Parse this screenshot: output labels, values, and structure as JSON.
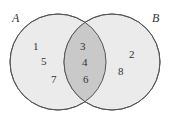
{
  "diagram": {
    "type": "venn",
    "sets": [
      {
        "name": "A",
        "label": "A",
        "only": [
          "1",
          "5",
          "7"
        ]
      },
      {
        "name": "B",
        "label": "B",
        "only": [
          "2",
          "8"
        ]
      }
    ],
    "intersection": [
      "3",
      "4",
      "6"
    ],
    "colors": {
      "fill": "#ebebeb",
      "intersection": "#c9c9c9",
      "stroke": "#555555"
    }
  }
}
